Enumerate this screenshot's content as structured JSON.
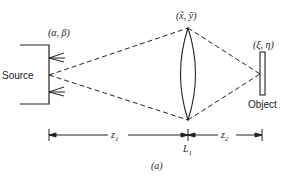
{
  "diagram": {
    "source_label": "Source",
    "source_coords": "(α, β)",
    "lens_coords": "(x̃, ỹ)",
    "object_coords": "(ξ, η)",
    "object_label": "Object",
    "z1_label": "z",
    "z1_sub": "1",
    "z2_label": "z",
    "z2_sub": "2",
    "lens_label": "L",
    "lens_sub": "1",
    "caption": "(a)"
  }
}
